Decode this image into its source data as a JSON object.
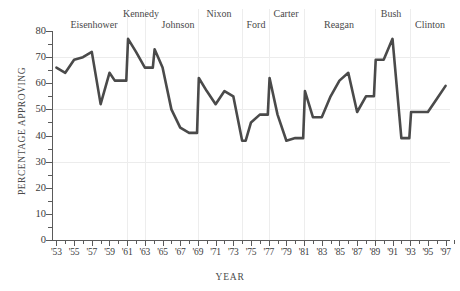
{
  "chart_data": {
    "type": "line",
    "title": "",
    "xlabel": "YEAR",
    "ylabel": "PERCENTAGE APPROVING",
    "xlim": [
      1952.5,
      1997.5
    ],
    "ylim": [
      0,
      80
    ],
    "grid": true,
    "legend": "none",
    "line_color": "#4a4a4a",
    "y_ticks": [
      0,
      10,
      20,
      30,
      40,
      50,
      60,
      70,
      80
    ],
    "y_tick_labels": [
      "0",
      "10",
      "20",
      "30",
      "40",
      "50",
      "60",
      "70",
      "80"
    ],
    "x_ticks": [
      1953,
      1955,
      1957,
      1959,
      1961,
      1963,
      1965,
      1967,
      1969,
      1971,
      1973,
      1975,
      1977,
      1979,
      1981,
      1983,
      1985,
      1987,
      1989,
      1991,
      1993,
      1995,
      1997
    ],
    "x_tick_labels": [
      "'53",
      "'55",
      "'57",
      "'59",
      "'61",
      "'63",
      "'65",
      "'67",
      "'69",
      "'71",
      "'73",
      "'75",
      "'77",
      "'79",
      "'81",
      "'83",
      "'85",
      "'87",
      "'89",
      "'91",
      "'93",
      "'95",
      "'97"
    ],
    "series": [
      {
        "name": "Presidential approval",
        "points": [
          [
            1953.0,
            66
          ],
          [
            1954.0,
            64
          ],
          [
            1955.0,
            69
          ],
          [
            1956.0,
            70
          ],
          [
            1957.0,
            72
          ],
          [
            1958.0,
            52
          ],
          [
            1959.0,
            64
          ],
          [
            1959.6,
            61
          ],
          [
            1960.9,
            61
          ],
          [
            1961.1,
            77
          ],
          [
            1962.0,
            72
          ],
          [
            1963.0,
            66
          ],
          [
            1963.9,
            66
          ],
          [
            1964.1,
            73
          ],
          [
            1965.0,
            66
          ],
          [
            1966.0,
            50
          ],
          [
            1967.0,
            43
          ],
          [
            1968.0,
            41
          ],
          [
            1968.9,
            41
          ],
          [
            1969.1,
            62
          ],
          [
            1970.0,
            57
          ],
          [
            1971.0,
            52
          ],
          [
            1972.0,
            57
          ],
          [
            1973.0,
            55
          ],
          [
            1974.0,
            38
          ],
          [
            1974.4,
            38
          ],
          [
            1975.0,
            45
          ],
          [
            1976.0,
            48
          ],
          [
            1976.9,
            48
          ],
          [
            1977.1,
            62
          ],
          [
            1978.0,
            48
          ],
          [
            1979.0,
            38
          ],
          [
            1980.0,
            39
          ],
          [
            1980.9,
            39
          ],
          [
            1981.1,
            57
          ],
          [
            1982.0,
            47
          ],
          [
            1983.0,
            47
          ],
          [
            1984.0,
            55
          ],
          [
            1985.0,
            61
          ],
          [
            1986.0,
            64
          ],
          [
            1987.0,
            49
          ],
          [
            1988.0,
            55
          ],
          [
            1988.9,
            55
          ],
          [
            1989.1,
            69
          ],
          [
            1990.0,
            69
          ],
          [
            1991.0,
            77
          ],
          [
            1992.0,
            39
          ],
          [
            1992.9,
            39
          ],
          [
            1993.1,
            49
          ],
          [
            1994.0,
            49
          ],
          [
            1995.0,
            49
          ],
          [
            1996.0,
            54
          ],
          [
            1997.0,
            59
          ]
        ]
      }
    ],
    "presidents": [
      {
        "name": "Eisenhower",
        "start": 1953,
        "end": 1961,
        "label_x": 94,
        "label_y": 19
      },
      {
        "name": "Kennedy",
        "start": 1961,
        "end": 1963,
        "label_x": 141,
        "label_y": 8
      },
      {
        "name": "Johnson",
        "start": 1963,
        "end": 1969,
        "label_x": 178,
        "label_y": 19
      },
      {
        "name": "Nixon",
        "start": 1969,
        "end": 1974,
        "label_x": 219,
        "label_y": 8
      },
      {
        "name": "Ford",
        "start": 1974,
        "end": 1977,
        "label_x": 256,
        "label_y": 19
      },
      {
        "name": "Carter",
        "start": 1977,
        "end": 1981,
        "label_x": 286,
        "label_y": 8
      },
      {
        "name": "Reagan",
        "start": 1981,
        "end": 1989,
        "label_x": 339,
        "label_y": 19
      },
      {
        "name": "Bush",
        "start": 1989,
        "end": 1993,
        "label_x": 391,
        "label_y": 8
      },
      {
        "name": "Clinton",
        "start": 1993,
        "end": 1998,
        "label_x": 430,
        "label_y": 19
      }
    ]
  }
}
